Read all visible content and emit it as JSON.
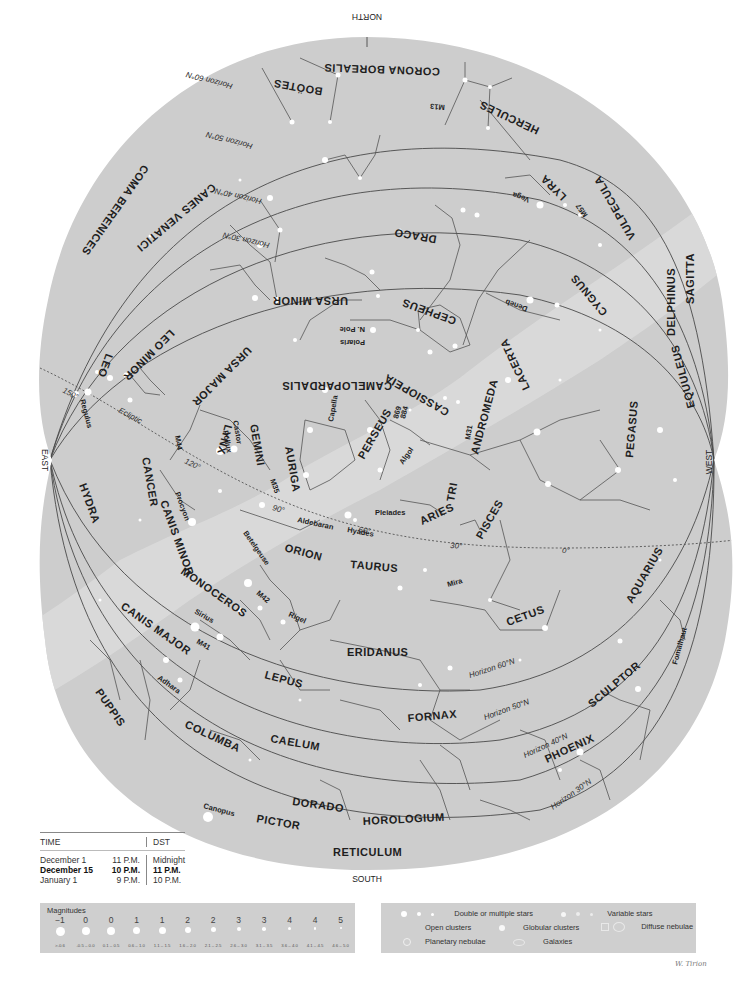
{
  "chart_data": {
    "type": "star-chart",
    "directions": {
      "north": "NORTH",
      "south": "SOUTH",
      "east": "EAST",
      "west": "WEST"
    },
    "ecliptic": {
      "label": "Ecliptic",
      "degree_marks": [
        "150°",
        "120°",
        "90°",
        "60°",
        "30°",
        "0°"
      ]
    },
    "horizons": [
      {
        "label": "Horizon 60°N"
      },
      {
        "label": "Horizon 50°N"
      },
      {
        "label": "Horizon 40°N"
      },
      {
        "label": "Horizon 30°N"
      }
    ],
    "constellations": [
      "CORONA BOREALIS",
      "BOÖTES",
      "HERCULES",
      "COMA BERENICES",
      "CANES VENATICI",
      "LYRA",
      "VULPECULA",
      "DRACO",
      "SAGITTA",
      "DELPHINUS",
      "CYGNUS",
      "URSA MINOR",
      "CEPHEUS",
      "URSA MAJOR",
      "LEO MINOR",
      "LEO",
      "LACERTA",
      "CAMELOPARDALIS",
      "CASSIOPEIA",
      "EQUULEUS",
      "LYNX",
      "ANDROMEDA",
      "PEGASUS",
      "PERSEUS",
      "GEMINI",
      "AURIGA",
      "CANCER",
      "HYDRA",
      "TRI",
      "ARIES",
      "PISCES",
      "CANIS MINOR",
      "ORION",
      "TAURUS",
      "MONOCEROS",
      "CETUS",
      "AQUARIUS",
      "CANIS MAJOR",
      "LEPUS",
      "ERIDANUS",
      "PUPPIS",
      "SCULPTOR",
      "FORNAX",
      "COLUMBA",
      "CAELUM",
      "PHOENIX",
      "DORADO",
      "PICTOR",
      "HOROLOGIUM",
      "RETICULUM"
    ],
    "named_objects": [
      "M13",
      "Vega",
      "M57",
      "Deneb",
      "Polaris",
      "N. Pole",
      "Regulus",
      "Castor",
      "Pollux",
      "M44",
      "Capella",
      "M35",
      "M31",
      "Algol",
      "869",
      "884",
      "Procyon",
      "Betelgeuse",
      "Aldebaran",
      "Hyades",
      "Pleiades",
      "Mira",
      "M42",
      "Rigel",
      "Sirius",
      "M41",
      "Adhara",
      "Canopus",
      "Fomalhaut"
    ]
  },
  "time_table": {
    "headers": [
      "TIME",
      "DST"
    ],
    "rows": [
      {
        "date": "December 1",
        "time": "11 P.M.",
        "dst": "Midnight",
        "bold": false
      },
      {
        "date": "December 15",
        "time": "10 P.M.",
        "dst": "11 P.M.",
        "bold": true
      },
      {
        "date": "January 1",
        "time": "9 P.M.",
        "dst": "10 P.M.",
        "bold": false
      }
    ]
  },
  "magnitude_legend": {
    "title": "Magnitudes",
    "classes": [
      {
        "mag": "−1",
        "range": ">-0.6"
      },
      {
        "mag": "0",
        "range": "-0.5 – 0.0"
      },
      {
        "mag": "0",
        "range": "0.1 – 0.5"
      },
      {
        "mag": "1",
        "range": "0.6 – 1.0"
      },
      {
        "mag": "1",
        "range": "1.1 – 1.5"
      },
      {
        "mag": "2",
        "range": "1.6 – 2.0"
      },
      {
        "mag": "2",
        "range": "2.1 – 2.5"
      },
      {
        "mag": "3",
        "range": "2.6 – 3.0"
      },
      {
        "mag": "3",
        "range": "3.1 – 3.5"
      },
      {
        "mag": "4",
        "range": "3.6 – 4.0"
      },
      {
        "mag": "4",
        "range": "4.1 – 4.5"
      },
      {
        "mag": "5",
        "range": "4.6 – 5.0"
      }
    ]
  },
  "symbol_legend": {
    "double_stars": "Double or multiple stars",
    "variable_stars": "Variable stars",
    "open_clusters": "Open clusters",
    "globular_clusters": "Globular clusters",
    "diffuse_nebulae": "Diffuse nebulae",
    "planetary_nebulae": "Planetary nebulae",
    "galaxies": "Galaxies"
  },
  "signature": "W. Tirion",
  "colors": {
    "sky": "#cdcdcd",
    "milky_way": "#dcdcdc",
    "lines": "#4a4a4a",
    "stars": "#ffffff"
  }
}
